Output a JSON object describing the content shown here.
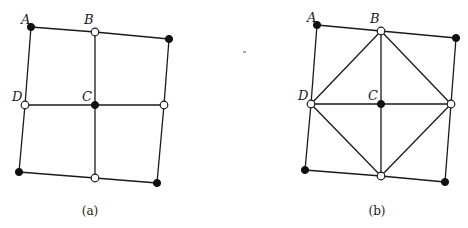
{
  "figure": {
    "panels": [
      {
        "id": "a",
        "caption": "(a)",
        "caption_pos": [
          90,
          215
        ],
        "nodes": [
          {
            "name": "A",
            "label": "A",
            "x": 31,
            "y": 27,
            "type": "filled",
            "label_pos": [
              21,
              24
            ]
          },
          {
            "name": "B",
            "label": "B",
            "x": 95,
            "y": 32,
            "type": "open",
            "label_pos": [
              84,
              24
            ]
          },
          {
            "name": "TR",
            "label": "",
            "x": 169,
            "y": 39,
            "type": "filled"
          },
          {
            "name": "D",
            "label": "D",
            "x": 25,
            "y": 105,
            "type": "open",
            "label_pos": [
              12,
              101
            ]
          },
          {
            "name": "C",
            "label": "C",
            "x": 95,
            "y": 105,
            "type": "filled",
            "label_pos": [
              82,
              101
            ]
          },
          {
            "name": "R",
            "label": "",
            "x": 164,
            "y": 105,
            "type": "open"
          },
          {
            "name": "BL",
            "label": "",
            "x": 19,
            "y": 172,
            "type": "filled"
          },
          {
            "name": "BM",
            "label": "",
            "x": 95,
            "y": 178,
            "type": "open"
          },
          {
            "name": "BR",
            "label": "",
            "x": 157,
            "y": 183,
            "type": "filled"
          }
        ],
        "edges": [
          [
            "A",
            "B"
          ],
          [
            "B",
            "TR"
          ],
          [
            "A",
            "D"
          ],
          [
            "D",
            "BL"
          ],
          [
            "TR",
            "R"
          ],
          [
            "R",
            "BR"
          ],
          [
            "BL",
            "BM"
          ],
          [
            "BM",
            "BR"
          ],
          [
            "D",
            "C"
          ],
          [
            "C",
            "R"
          ],
          [
            "B",
            "C"
          ],
          [
            "C",
            "BM"
          ]
        ]
      },
      {
        "id": "b",
        "caption": "(b)",
        "caption_pos": [
          377,
          215
        ],
        "nodes": [
          {
            "name": "A",
            "label": "A",
            "x": 317,
            "y": 25,
            "type": "filled",
            "label_pos": [
              307,
              22
            ]
          },
          {
            "name": "B",
            "label": "B",
            "x": 381,
            "y": 31,
            "type": "open",
            "label_pos": [
              370,
              23
            ]
          },
          {
            "name": "TR",
            "label": "",
            "x": 456,
            "y": 38,
            "type": "filled"
          },
          {
            "name": "D",
            "label": "D",
            "x": 311,
            "y": 104,
            "type": "open",
            "label_pos": [
              298,
              100
            ]
          },
          {
            "name": "C",
            "label": "C",
            "x": 381,
            "y": 104,
            "type": "filled",
            "label_pos": [
              368,
              100
            ]
          },
          {
            "name": "R",
            "label": "",
            "x": 451,
            "y": 104,
            "type": "open"
          },
          {
            "name": "BL",
            "label": "",
            "x": 305,
            "y": 170,
            "type": "filled"
          },
          {
            "name": "BM",
            "label": "",
            "x": 381,
            "y": 176,
            "type": "open"
          },
          {
            "name": "BR",
            "label": "",
            "x": 445,
            "y": 182,
            "type": "filled"
          }
        ],
        "edges": [
          [
            "A",
            "B"
          ],
          [
            "B",
            "TR"
          ],
          [
            "A",
            "D"
          ],
          [
            "D",
            "BL"
          ],
          [
            "TR",
            "R"
          ],
          [
            "R",
            "BR"
          ],
          [
            "BL",
            "BM"
          ],
          [
            "BM",
            "BR"
          ],
          [
            "D",
            "C"
          ],
          [
            "C",
            "R"
          ],
          [
            "B",
            "C"
          ],
          [
            "C",
            "BM"
          ],
          [
            "B",
            "D"
          ],
          [
            "B",
            "R"
          ],
          [
            "D",
            "BM"
          ],
          [
            "R",
            "BM"
          ]
        ]
      }
    ],
    "artifact_speck": {
      "x": 245,
      "y": 52
    }
  }
}
